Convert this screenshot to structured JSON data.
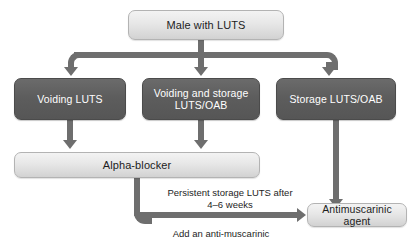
{
  "diagram": {
    "colors": {
      "light_box_fill": "#e7e7e7",
      "light_box_border": "#b3b3b3",
      "dark_box_fill": "#5d5d5d",
      "dark_box_border": "#4b4b4b",
      "connector": "#6e6e6e",
      "dark_text": "#1d1d1d",
      "light_text": "#ffffff",
      "background": "#ffffff"
    },
    "nodes": [
      {
        "id": "male-with-luts",
        "label": "Male with LUTS",
        "style": "light"
      },
      {
        "id": "voiding-luts",
        "label": "Voiding LUTS",
        "style": "dark"
      },
      {
        "id": "voiding-and-storage",
        "line1": "Voiding and storage",
        "line2": "LUTS/OAB",
        "style": "dark"
      },
      {
        "id": "storage-luts-oab",
        "label": "Storage LUTS/OAB",
        "style": "dark"
      },
      {
        "id": "alpha-blocker",
        "label": "Alpha-blocker",
        "style": "light"
      },
      {
        "id": "antimuscarinic",
        "label": "Antimuscarinic agent",
        "style": "light"
      }
    ],
    "captions": {
      "persistent_line1": "Persistent storage LUTS after",
      "persistent_line2": "4–6 weeks",
      "add_anti_muscarinic": "Add an anti-muscarinic"
    },
    "edges": [
      {
        "from": "male-with-luts",
        "to": "voiding-luts"
      },
      {
        "from": "male-with-luts",
        "to": "voiding-and-storage"
      },
      {
        "from": "male-with-luts",
        "to": "storage-luts-oab"
      },
      {
        "from": "voiding-luts",
        "to": "alpha-blocker"
      },
      {
        "from": "voiding-and-storage",
        "to": "alpha-blocker"
      },
      {
        "from": "storage-luts-oab",
        "to": "antimuscarinic"
      },
      {
        "from": "alpha-blocker",
        "to": "antimuscarinic",
        "label": "Persistent storage LUTS after 4–6 weeks"
      }
    ]
  }
}
